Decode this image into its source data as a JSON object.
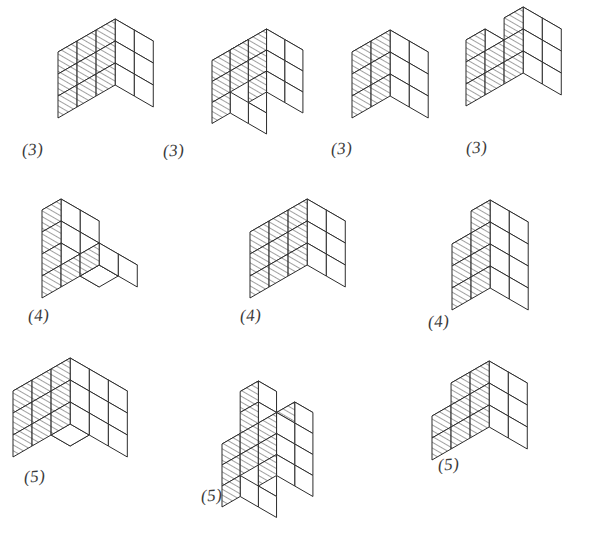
{
  "page": {
    "background_color": "#ffffff",
    "ink_color": "#2b2b2b",
    "label_color": "#3a3a3a",
    "width": 598,
    "height": 540,
    "rows": 3,
    "figure_count": 10
  },
  "style": {
    "hatch_description": "parallel diagonal hatch lines on left-facing cube faces",
    "hatch_angle_deg": 30,
    "cube_size_px": 22,
    "label_format": "(n)"
  },
  "figures": [
    {
      "id": "figure-1",
      "row": 1,
      "column": 1,
      "label": "(3)",
      "label_value": 3,
      "origin": {
        "x": 96,
        "y": 140
      },
      "cube_size": 22,
      "cubes": [
        [
          0,
          0,
          0
        ],
        [
          1,
          0,
          0
        ],
        [
          2,
          0,
          0
        ],
        [
          0,
          1,
          0
        ],
        [
          1,
          1,
          0
        ],
        [
          2,
          1,
          0
        ],
        [
          0,
          0,
          1
        ],
        [
          1,
          0,
          1
        ],
        [
          2,
          0,
          1
        ],
        [
          0,
          1,
          1
        ],
        [
          1,
          1,
          1
        ],
        [
          2,
          1,
          1
        ],
        [
          0,
          0,
          2
        ],
        [
          2,
          0,
          2
        ],
        [
          0,
          1,
          2
        ],
        [
          1,
          1,
          2
        ],
        [
          2,
          1,
          2
        ]
      ]
    },
    {
      "id": "figure-2",
      "row": 1,
      "column": 2,
      "label": "(3)",
      "label_value": 3,
      "origin": {
        "x": 248,
        "y": 144
      },
      "cube_size": 21,
      "cubes": [
        [
          0,
          0,
          0
        ],
        [
          0,
          1,
          0
        ],
        [
          2,
          0,
          0
        ],
        [
          2,
          1,
          0
        ],
        [
          0,
          0,
          1
        ],
        [
          0,
          1,
          1
        ],
        [
          1,
          1,
          1
        ],
        [
          2,
          0,
          1
        ],
        [
          2,
          1,
          1
        ],
        [
          0,
          0,
          2
        ],
        [
          0,
          1,
          2
        ],
        [
          1,
          0,
          2
        ],
        [
          1,
          1,
          2
        ],
        [
          2,
          0,
          2
        ],
        [
          2,
          1,
          2
        ],
        [
          0,
          0,
          3
        ]
      ]
    },
    {
      "id": "figure-3",
      "row": 1,
      "column": 3,
      "label": "(3)",
      "label_value": 3,
      "origin": {
        "x": 390,
        "y": 140
      },
      "cube_size": 22,
      "cubes": [
        [
          0,
          0,
          0
        ],
        [
          1,
          0,
          0
        ],
        [
          0,
          1,
          0
        ],
        [
          1,
          1,
          0
        ],
        [
          0,
          0,
          1
        ],
        [
          1,
          0,
          1
        ],
        [
          0,
          1,
          1
        ],
        [
          1,
          1,
          1
        ],
        [
          0,
          0,
          2
        ],
        [
          1,
          0,
          2
        ],
        [
          0,
          1,
          2
        ],
        [
          1,
          1,
          2
        ]
      ]
    },
    {
      "id": "figure-4",
      "row": 1,
      "column": 4,
      "label": "(3)",
      "label_value": 3,
      "origin": {
        "x": 504,
        "y": 128
      },
      "cube_size": 22,
      "cubes": [
        [
          0,
          0,
          0
        ],
        [
          1,
          0,
          0
        ],
        [
          2,
          0,
          0
        ],
        [
          0,
          1,
          0
        ],
        [
          1,
          1,
          0
        ],
        [
          2,
          1,
          0
        ],
        [
          0,
          0,
          1
        ],
        [
          1,
          0,
          1
        ],
        [
          2,
          0,
          1
        ],
        [
          0,
          1,
          1
        ],
        [
          1,
          1,
          1
        ],
        [
          2,
          1,
          1
        ],
        [
          0,
          1,
          2
        ],
        [
          2,
          0,
          2
        ],
        [
          2,
          1,
          2
        ],
        [
          0,
          0,
          2
        ]
      ]
    },
    {
      "id": "figure-5",
      "row": 2,
      "column": 1,
      "label": "(4)",
      "label_value": 4,
      "origin": {
        "x": 80,
        "y": 320
      },
      "cube_size": 22,
      "cubes": [
        [
          0,
          0,
          0
        ],
        [
          1,
          0,
          0
        ],
        [
          2,
          0,
          0
        ],
        [
          0,
          1,
          0
        ],
        [
          1,
          1,
          0
        ],
        [
          2,
          1,
          0
        ],
        [
          0,
          0,
          1
        ],
        [
          0,
          1,
          1
        ],
        [
          0,
          0,
          2
        ],
        [
          0,
          1,
          2
        ],
        [
          0,
          0,
          3
        ],
        [
          0,
          1,
          3
        ]
      ]
    },
    {
      "id": "figure-6",
      "row": 2,
      "column": 2,
      "label": "(4)",
      "label_value": 4,
      "origin": {
        "x": 288,
        "y": 320
      },
      "cube_size": 22,
      "cubes": [
        [
          0,
          0,
          0
        ],
        [
          1,
          0,
          0
        ],
        [
          2,
          0,
          0
        ],
        [
          0,
          1,
          0
        ],
        [
          1,
          1,
          0
        ],
        [
          2,
          1,
          0
        ],
        [
          0,
          0,
          1
        ],
        [
          1,
          0,
          1
        ],
        [
          2,
          0,
          1
        ],
        [
          0,
          1,
          1
        ],
        [
          1,
          1,
          1
        ],
        [
          2,
          1,
          1
        ],
        [
          0,
          0,
          2
        ],
        [
          2,
          0,
          2
        ],
        [
          0,
          1,
          2
        ],
        [
          1,
          1,
          2
        ],
        [
          2,
          1,
          2
        ]
      ]
    },
    {
      "id": "figure-7",
      "row": 2,
      "column": 3,
      "label": "(4)",
      "label_value": 4,
      "origin": {
        "x": 490,
        "y": 332
      },
      "cube_size": 22,
      "cubes": [
        [
          0,
          0,
          0
        ],
        [
          1,
          0,
          0
        ],
        [
          0,
          1,
          0
        ],
        [
          1,
          1,
          0
        ],
        [
          0,
          0,
          1
        ],
        [
          1,
          0,
          1
        ],
        [
          0,
          1,
          1
        ],
        [
          1,
          1,
          1
        ],
        [
          0,
          0,
          2
        ],
        [
          1,
          0,
          2
        ],
        [
          0,
          1,
          2
        ],
        [
          1,
          1,
          2
        ],
        [
          0,
          0,
          3
        ],
        [
          1,
          0,
          3
        ],
        [
          1,
          1,
          3
        ]
      ]
    },
    {
      "id": "figure-8",
      "row": 3,
      "column": 1,
      "label": "(5)",
      "label_value": 5,
      "origin": {
        "x": 70,
        "y": 490
      },
      "cube_size": 22,
      "cubes": [
        [
          0,
          0,
          0
        ],
        [
          1,
          0,
          0
        ],
        [
          2,
          0,
          0
        ],
        [
          0,
          1,
          0
        ],
        [
          1,
          1,
          0
        ],
        [
          2,
          1,
          0
        ],
        [
          0,
          2,
          0
        ],
        [
          1,
          2,
          0
        ],
        [
          2,
          2,
          0
        ],
        [
          0,
          0,
          1
        ],
        [
          1,
          0,
          1
        ],
        [
          2,
          0,
          1
        ],
        [
          0,
          1,
          1
        ],
        [
          2,
          1,
          1
        ],
        [
          0,
          2,
          1
        ],
        [
          1,
          2,
          1
        ],
        [
          2,
          2,
          1
        ],
        [
          0,
          0,
          2
        ],
        [
          1,
          0,
          2
        ],
        [
          2,
          0,
          2
        ],
        [
          0,
          1,
          2
        ],
        [
          1,
          1,
          2
        ],
        [
          2,
          1,
          2
        ],
        [
          0,
          2,
          2
        ],
        [
          1,
          2,
          2
        ],
        [
          2,
          2,
          2
        ]
      ]
    },
    {
      "id": "figure-9",
      "row": 3,
      "column": 2,
      "label": "(5)",
      "label_value": 5,
      "origin": {
        "x": 258,
        "y": 528
      },
      "cube_size": 21,
      "cubes": [
        [
          0,
          0,
          0
        ],
        [
          0,
          1,
          0
        ],
        [
          2,
          0,
          0
        ],
        [
          2,
          1,
          0
        ],
        [
          0,
          0,
          1
        ],
        [
          0,
          1,
          1
        ],
        [
          1,
          1,
          1
        ],
        [
          2,
          0,
          1
        ],
        [
          2,
          1,
          1
        ],
        [
          0,
          0,
          2
        ],
        [
          0,
          1,
          2
        ],
        [
          1,
          1,
          2
        ],
        [
          2,
          0,
          2
        ],
        [
          2,
          1,
          2
        ],
        [
          1,
          1,
          3
        ],
        [
          2,
          0,
          3
        ],
        [
          1,
          1,
          4
        ]
      ]
    },
    {
      "id": "figure-10",
      "row": 3,
      "column": 3,
      "label": "(5)",
      "label_value": 5,
      "origin": {
        "x": 470,
        "y": 482
      },
      "cube_size": 22,
      "cubes": [
        [
          0,
          0,
          0
        ],
        [
          1,
          0,
          0
        ],
        [
          2,
          0,
          0
        ],
        [
          0,
          1,
          0
        ],
        [
          1,
          1,
          0
        ],
        [
          2,
          1,
          0
        ],
        [
          0,
          0,
          1
        ],
        [
          1,
          0,
          1
        ],
        [
          2,
          0,
          1
        ],
        [
          0,
          1,
          1
        ],
        [
          1,
          1,
          1
        ],
        [
          2,
          1,
          1
        ],
        [
          0,
          0,
          2
        ],
        [
          1,
          0,
          2
        ],
        [
          2,
          0,
          2
        ],
        [
          1,
          1,
          2
        ],
        [
          2,
          1,
          2
        ]
      ]
    }
  ],
  "labels": [
    {
      "text": "(3)",
      "x": 22,
      "y": 140
    },
    {
      "text": "(3)",
      "x": 163,
      "y": 141
    },
    {
      "text": "(3)",
      "x": 331,
      "y": 139
    },
    {
      "text": "(3)",
      "x": 466,
      "y": 138
    },
    {
      "text": "(4)",
      "x": 28,
      "y": 306
    },
    {
      "text": "(4)",
      "x": 240,
      "y": 306
    },
    {
      "text": "(4)",
      "x": 428,
      "y": 312
    },
    {
      "text": "(5)",
      "x": 24,
      "y": 467
    },
    {
      "text": "(5)",
      "x": 201,
      "y": 486
    },
    {
      "text": "(5)",
      "x": 438,
      "y": 455
    }
  ]
}
